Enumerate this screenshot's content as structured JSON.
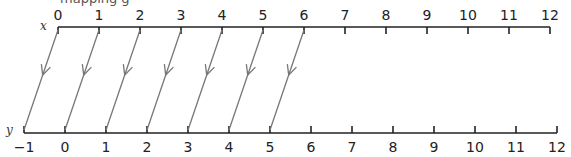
{
  "caption": "mapping g",
  "colors": {
    "axis": "#222222",
    "arrow": "#777777"
  },
  "diagram": {
    "type": "number-line mapping",
    "top_axis": {
      "label": "x",
      "ticks": [
        "0",
        "1",
        "2",
        "3",
        "4",
        "5",
        "6",
        "7",
        "8",
        "9",
        "10",
        "11",
        "12"
      ],
      "x_start": 58,
      "spacing": 41,
      "y": 27
    },
    "bottom_axis": {
      "label": "y",
      "ticks": [
        "−1",
        "0",
        "1",
        "2",
        "3",
        "4",
        "5",
        "6",
        "7",
        "8",
        "9",
        "10",
        "11",
        "12"
      ],
      "x_start": 24,
      "spacing": 41,
      "y": 133
    },
    "arrows": [
      {
        "from": 0,
        "to": -1
      },
      {
        "from": 1,
        "to": 0
      },
      {
        "from": 2,
        "to": 1
      },
      {
        "from": 3,
        "to": 2
      },
      {
        "from": 4,
        "to": 3
      },
      {
        "from": 5,
        "to": 4
      },
      {
        "from": 6,
        "to": 5
      }
    ]
  }
}
